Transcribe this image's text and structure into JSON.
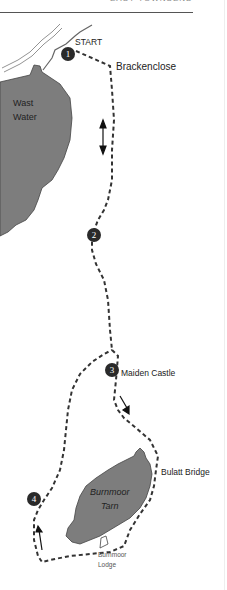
{
  "header": {
    "running_title": "EASY TOWNSEND"
  },
  "map": {
    "lakes": [
      {
        "id": "wast-water",
        "name_line1": "Wast",
        "name_line2": "Water"
      },
      {
        "id": "burnmoor-tarn",
        "name_line1": "Burnmoor",
        "name_line2": "Tarn"
      }
    ],
    "labels": {
      "start": "START",
      "brackenclose": "Brackenclose",
      "maiden_castle": "Maiden Castle",
      "bulatt_bridge": "Bulatt Bridge",
      "burnmoor_lodge_line1": "Burnmoor",
      "burnmoor_lodge_line2": "Lodge"
    },
    "waypoints": [
      "1",
      "2",
      "3",
      "4"
    ],
    "colors": {
      "lake_fill": "#7d7d7d",
      "route": "#333333",
      "marker": "#2a2a2a"
    }
  }
}
